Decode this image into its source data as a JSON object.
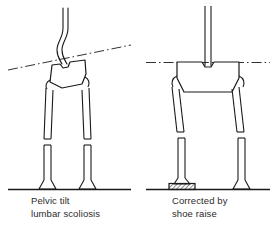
{
  "figure": {
    "background_color": "#ffffff",
    "line_color": "#1a1a1a",
    "text_color": "#2b2b2b"
  },
  "panels": [
    {
      "id": "left",
      "caption_line1": "Pelvic tilt",
      "caption_line2": "lumbar scoliosis",
      "condition": "uncorrected",
      "spine": "S-curved lumbar scoliosis",
      "pelvis_state": "tilted",
      "pelvic_reference_line": "oblique dash-dot line",
      "shoe_raise": "none",
      "leg_length_discrepancy": "present"
    },
    {
      "id": "right",
      "caption_line1": "Corrected by",
      "caption_line2": "shoe raise",
      "condition": "corrected",
      "spine": "straight vertical",
      "pelvis_state": "level",
      "pelvic_reference_line": "horizontal dash-dot line",
      "shoe_raise": "hatched block under left foot",
      "leg_length_discrepancy": "compensated"
    }
  ],
  "elements": {
    "spine_label": "spine",
    "pelvis_label": "pelvis",
    "femur_label": "femur",
    "tibia_label": "tibia",
    "foot_label": "foot",
    "ground_label": "ground line",
    "reference_label": "pelvic reference line",
    "shoe_raise_label": "shoe raise block"
  }
}
